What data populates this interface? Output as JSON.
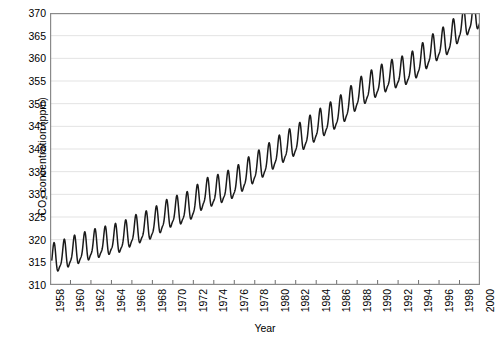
{
  "chart_data": {
    "type": "line",
    "title": "",
    "xlabel": "Year",
    "ylabel": "CO2 concentration (ppm)",
    "ylabel_parts": {
      "prefix": "CO",
      "sub": "2",
      "suffix": " concentration (ppm)"
    },
    "xlim": [
      1958,
      2000
    ],
    "ylim": [
      310,
      370
    ],
    "xticks": [
      1958,
      1960,
      1962,
      1964,
      1966,
      1968,
      1970,
      1972,
      1974,
      1976,
      1978,
      1980,
      1982,
      1984,
      1986,
      1988,
      1990,
      1992,
      1994,
      1996,
      1998,
      2000
    ],
    "yticks": [
      310,
      315,
      320,
      325,
      330,
      335,
      340,
      345,
      350,
      355,
      360,
      365,
      370
    ],
    "grid": "horizontal",
    "legend": "none",
    "series": [
      {
        "name": "Mauna Loa monthly mean CO2",
        "color": "#1a1a1a",
        "description": "Keeling Curve: rising trend with annual seasonal sawtooth oscillation of roughly 6 ppm peak-to-trough, maxima in May and minima in late September/October.",
        "annual_mean": {
          "x": [
            1958,
            1959,
            1960,
            1961,
            1962,
            1963,
            1964,
            1965,
            1966,
            1967,
            1968,
            1969,
            1970,
            1971,
            1972,
            1973,
            1974,
            1975,
            1976,
            1977,
            1978,
            1979,
            1980,
            1981,
            1982,
            1983,
            1984,
            1985,
            1986,
            1987,
            1988,
            1989,
            1990,
            1991,
            1992,
            1993,
            1994,
            1995,
            1996,
            1997,
            1998,
            1999,
            2000
          ],
          "y": [
            315.3,
            315.9,
            316.9,
            317.6,
            318.4,
            318.9,
            319.6,
            320.0,
            321.4,
            322.2,
            323.0,
            324.6,
            325.7,
            326.3,
            327.5,
            329.7,
            330.2,
            331.1,
            332.0,
            333.8,
            335.4,
            336.8,
            338.7,
            340.1,
            341.4,
            343.0,
            344.6,
            346.0,
            347.4,
            349.2,
            351.6,
            353.1,
            354.4,
            355.6,
            356.4,
            357.1,
            358.8,
            360.9,
            362.6,
            363.8,
            366.6,
            368.3,
            369.5
          ]
        },
        "seasonal_amplitude_ppm": 6.0,
        "seasonal_peak_month": 5,
        "seasonal_trough_month": 10
      }
    ]
  },
  "axis": {
    "y_tick_labels": [
      "370",
      "365",
      "360",
      "355",
      "350",
      "345",
      "340",
      "335",
      "330",
      "325",
      "320",
      "315",
      "310"
    ],
    "x_tick_labels": [
      "1958",
      "1960",
      "1962",
      "1964",
      "1966",
      "1968",
      "1970",
      "1972",
      "1974",
      "1976",
      "1978",
      "1980",
      "1982",
      "1984",
      "1986",
      "1988",
      "1990",
      "1992",
      "1994",
      "1996",
      "1998",
      "2000"
    ]
  },
  "style": {
    "line_color": "#1a1a1a",
    "grid_color": "#e3e3e3",
    "spine_color": "#8a8a8a",
    "background": "#ffffff",
    "text_color": "#000000"
  }
}
